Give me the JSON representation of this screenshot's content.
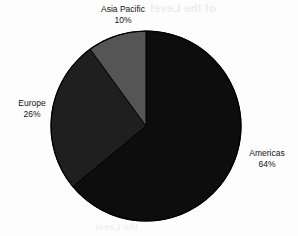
{
  "background": {
    "color": "#fdfdfd",
    "bleed_through_top": "of the Level",
    "bleed_through_bottom": "the Level"
  },
  "chart_data": {
    "type": "pie",
    "title": "",
    "subtitle": "",
    "xlabel": "",
    "ylabel": "",
    "legend_position": "none",
    "grid": false,
    "start_angle_deg": 0,
    "direction": "clockwise",
    "units": "%",
    "categories": [
      "Americas",
      "Europe",
      "Asia Pacific"
    ],
    "values": [
      64,
      26,
      10
    ],
    "total": 100,
    "colors": [
      "#0d0d0d",
      "#1f1f1f",
      "#555555"
    ],
    "slices": [
      {
        "name": "Americas",
        "value": 64,
        "value_label": "64%",
        "color": "#0d0d0d",
        "label_position": "right"
      },
      {
        "name": "Europe",
        "value": 26,
        "value_label": "26%",
        "color": "#1f1f1f",
        "label_position": "left"
      },
      {
        "name": "Asia Pacific",
        "value": 10,
        "value_label": "10%",
        "color": "#555555",
        "label_position": "top"
      }
    ],
    "geometry": {
      "center_x": 146,
      "center_y": 126,
      "radius": 95,
      "outline_color": "#000000"
    }
  }
}
